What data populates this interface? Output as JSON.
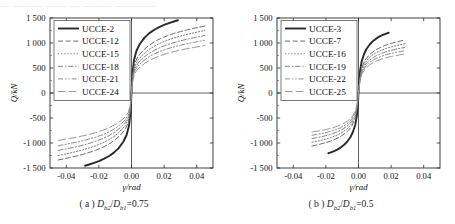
{
  "page": {
    "bleed_text": "— ———  ——  — ———  ————"
  },
  "panels": [
    {
      "id": "panel-a",
      "caption_prefix": "( a )",
      "caption_var_num": "D",
      "caption_sub_num": "b2",
      "caption_var_den": "D",
      "caption_sub_den": "b1",
      "caption_value": "=0.75",
      "caption_full": "( a ) Db2/Db1=0.75",
      "chart_data": {
        "type": "line",
        "title": "",
        "xlabel": "γ/rad",
        "ylabel": "Q/kN",
        "xlim": [
          -0.05,
          0.05
        ],
        "ylim": [
          -1500,
          1500
        ],
        "xticks": [
          -0.04,
          -0.02,
          0.0,
          0.02,
          0.04
        ],
        "xticklabels": [
          "-0.04",
          "-0.02",
          "0.00",
          "0.02",
          "0.04"
        ],
        "yticks": [
          -1500,
          -1000,
          -500,
          0,
          500,
          1000,
          1500
        ],
        "yticklabels": [
          "-1 500",
          "-1 000",
          "-500",
          "0",
          "500",
          "1 000",
          "1 500"
        ],
        "grid": false,
        "legend_position": "upper-left",
        "series": [
          {
            "name": "UCCE-2",
            "style": "solid",
            "width": 1.9,
            "color": "#2b2b2b",
            "x": [
              -0.0285,
              -0.026,
              -0.023,
              -0.02,
              -0.017,
              -0.014,
              -0.011,
              -0.008,
              -0.005,
              -0.003,
              -0.0015,
              -0.0006,
              0,
              0.0006,
              0.0015,
              0.003,
              0.005,
              0.008,
              0.011,
              0.014,
              0.017,
              0.02,
              0.023,
              0.026,
              0.0285
            ],
            "y": [
              -1455,
              -1430,
              -1398,
              -1362,
              -1318,
              -1265,
              -1198,
              -1108,
              -975,
              -840,
              -650,
              -390,
              0,
              390,
              650,
              840,
              975,
              1108,
              1198,
              1265,
              1318,
              1362,
              1398,
              1430,
              1455
            ]
          },
          {
            "name": "UCCE-12",
            "style": "dashed",
            "width": 1.0,
            "color": "#6e6e6e",
            "x": [
              -0.045,
              -0.042,
              -0.038,
              -0.034,
              -0.03,
              -0.026,
              -0.022,
              -0.018,
              -0.014,
              -0.01,
              -0.007,
              -0.004,
              -0.002,
              -0.0008,
              0,
              0.0008,
              0.002,
              0.004,
              0.007,
              0.01,
              0.014,
              0.018,
              0.022,
              0.026,
              0.03,
              0.034,
              0.038,
              0.042,
              0.045
            ],
            "y": [
              -1340,
              -1320,
              -1292,
              -1262,
              -1228,
              -1190,
              -1145,
              -1092,
              -1025,
              -935,
              -848,
              -730,
              -600,
              -380,
              0,
              380,
              600,
              730,
              848,
              935,
              1025,
              1092,
              1145,
              1190,
              1228,
              1262,
              1292,
              1320,
              1340
            ]
          },
          {
            "name": "UCCE-15",
            "style": "dotted",
            "width": 1.0,
            "color": "#7d7d7d",
            "x": [
              -0.045,
              -0.042,
              -0.038,
              -0.034,
              -0.03,
              -0.026,
              -0.022,
              -0.018,
              -0.014,
              -0.01,
              -0.007,
              -0.004,
              -0.002,
              -0.0008,
              0,
              0.0008,
              0.002,
              0.004,
              0.007,
              0.01,
              0.014,
              0.018,
              0.022,
              0.026,
              0.03,
              0.034,
              0.038,
              0.042,
              0.045
            ],
            "y": [
              -1250,
              -1230,
              -1202,
              -1172,
              -1138,
              -1100,
              -1055,
              -1002,
              -938,
              -852,
              -768,
              -658,
              -538,
              -340,
              0,
              340,
              538,
              658,
              768,
              852,
              938,
              1002,
              1055,
              1100,
              1138,
              1172,
              1202,
              1230,
              1250
            ]
          },
          {
            "name": "UCCE-18",
            "style": "dashdot",
            "width": 1.0,
            "color": "#858585",
            "x": [
              -0.045,
              -0.042,
              -0.038,
              -0.034,
              -0.03,
              -0.026,
              -0.022,
              -0.018,
              -0.014,
              -0.01,
              -0.007,
              -0.004,
              -0.002,
              -0.0008,
              0,
              0.0008,
              0.002,
              0.004,
              0.007,
              0.01,
              0.014,
              0.018,
              0.022,
              0.026,
              0.03,
              0.034,
              0.038,
              0.042,
              0.045
            ],
            "y": [
              -1150,
              -1130,
              -1104,
              -1076,
              -1044,
              -1008,
              -966,
              -916,
              -856,
              -776,
              -698,
              -596,
              -486,
              -306,
              0,
              306,
              486,
              596,
              698,
              776,
              856,
              916,
              966,
              1008,
              1044,
              1076,
              1104,
              1130,
              1150
            ]
          },
          {
            "name": "UCCE-21",
            "style": "dashdotdot",
            "width": 1.0,
            "color": "#8d8d8d",
            "x": [
              -0.045,
              -0.042,
              -0.038,
              -0.034,
              -0.03,
              -0.026,
              -0.022,
              -0.018,
              -0.014,
              -0.01,
              -0.007,
              -0.004,
              -0.002,
              -0.0008,
              0,
              0.0008,
              0.002,
              0.004,
              0.007,
              0.01,
              0.014,
              0.018,
              0.022,
              0.026,
              0.03,
              0.034,
              0.038,
              0.042,
              0.045
            ],
            "y": [
              -1055,
              -1036,
              -1012,
              -986,
              -956,
              -922,
              -884,
              -838,
              -782,
              -708,
              -636,
              -542,
              -442,
              -278,
              0,
              278,
              442,
              542,
              636,
              708,
              782,
              838,
              884,
              922,
              956,
              986,
              1012,
              1036,
              1055
            ]
          },
          {
            "name": "UCCE-24",
            "style": "longdash",
            "width": 1.0,
            "color": "#989898",
            "x": [
              -0.045,
              -0.042,
              -0.038,
              -0.034,
              -0.03,
              -0.026,
              -0.022,
              -0.018,
              -0.014,
              -0.01,
              -0.007,
              -0.004,
              -0.002,
              -0.0008,
              0,
              0.0008,
              0.002,
              0.004,
              0.007,
              0.01,
              0.014,
              0.018,
              0.022,
              0.026,
              0.03,
              0.034,
              0.038,
              0.042,
              0.045
            ],
            "y": [
              -950,
              -932,
              -910,
              -886,
              -858,
              -828,
              -792,
              -750,
              -700,
              -632,
              -566,
              -482,
              -392,
              -246,
              0,
              246,
              392,
              482,
              566,
              632,
              700,
              750,
              792,
              828,
              858,
              886,
              910,
              932,
              950
            ]
          }
        ]
      }
    },
    {
      "id": "panel-b",
      "caption_prefix": "( b )",
      "caption_var_num": "D",
      "caption_sub_num": "b2",
      "caption_var_den": "D",
      "caption_sub_den": "b1",
      "caption_value": "=0.5",
      "caption_full": "( b ) Db2/Db1=0.5",
      "chart_data": {
        "type": "line",
        "title": "",
        "xlabel": "γ/rad",
        "ylabel": "Q/kN",
        "xlim": [
          -0.05,
          0.05
        ],
        "ylim": [
          -1500,
          1500
        ],
        "xticks": [
          -0.04,
          -0.02,
          0.0,
          0.02,
          0.04
        ],
        "xticklabels": [
          "-0.04",
          "-0.02",
          "0.00",
          "0.02",
          "0.04"
        ],
        "yticks": [
          -1500,
          -1000,
          -500,
          0,
          500,
          1000,
          1500
        ],
        "yticklabels": [
          "-1 500",
          "-1 000",
          "-500",
          "0",
          "500",
          "1 000",
          "1 500"
        ],
        "grid": false,
        "legend_position": "upper-left",
        "series": [
          {
            "name": "UCCE-3",
            "style": "solid",
            "width": 1.9,
            "color": "#2b2b2b",
            "x": [
              -0.0185,
              -0.017,
              -0.015,
              -0.013,
              -0.011,
              -0.009,
              -0.007,
              -0.005,
              -0.0035,
              -0.002,
              -0.001,
              -0.0004,
              0,
              0.0004,
              0.001,
              0.002,
              0.0035,
              0.005,
              0.007,
              0.009,
              0.011,
              0.013,
              0.015,
              0.017,
              0.0185
            ],
            "y": [
              -1205,
              -1188,
              -1162,
              -1132,
              -1092,
              -1042,
              -975,
              -885,
              -785,
              -640,
              -452,
              -250,
              0,
              250,
              452,
              640,
              785,
              885,
              975,
              1042,
              1092,
              1132,
              1162,
              1188,
              1205
            ]
          },
          {
            "name": "UCCE-7",
            "style": "dashed",
            "width": 1.0,
            "color": "#6e6e6e",
            "x": [
              -0.0285,
              -0.026,
              -0.023,
              -0.02,
              -0.017,
              -0.014,
              -0.011,
              -0.008,
              -0.006,
              -0.004,
              -0.002,
              -0.0008,
              0,
              0.0008,
              0.002,
              0.004,
              0.006,
              0.008,
              0.011,
              0.014,
              0.017,
              0.02,
              0.023,
              0.026,
              0.0285
            ],
            "y": [
              -1060,
              -1042,
              -1018,
              -992,
              -960,
              -920,
              -870,
              -802,
              -740,
              -655,
              -508,
              -288,
              0,
              288,
              508,
              655,
              740,
              802,
              870,
              920,
              960,
              992,
              1018,
              1042,
              1060
            ]
          },
          {
            "name": "UCCE-16",
            "style": "dotted",
            "width": 1.0,
            "color": "#7d7d7d",
            "x": [
              -0.0285,
              -0.026,
              -0.023,
              -0.02,
              -0.017,
              -0.014,
              -0.011,
              -0.008,
              -0.006,
              -0.004,
              -0.002,
              -0.0008,
              0,
              0.0008,
              0.002,
              0.004,
              0.006,
              0.008,
              0.011,
              0.014,
              0.017,
              0.02,
              0.023,
              0.026,
              0.0285
            ],
            "y": [
              -985,
              -968,
              -946,
              -922,
              -892,
              -854,
              -808,
              -744,
              -686,
              -606,
              -470,
              -266,
              0,
              266,
              470,
              606,
              686,
              744,
              808,
              854,
              892,
              922,
              946,
              968,
              985
            ]
          },
          {
            "name": "UCCE-19",
            "style": "dashdot",
            "width": 1.0,
            "color": "#858585",
            "x": [
              -0.0285,
              -0.026,
              -0.023,
              -0.02,
              -0.017,
              -0.014,
              -0.011,
              -0.008,
              -0.006,
              -0.004,
              -0.002,
              -0.0008,
              0,
              0.0008,
              0.002,
              0.004,
              0.006,
              0.008,
              0.011,
              0.014,
              0.017,
              0.02,
              0.023,
              0.026,
              0.0285
            ],
            "y": [
              -912,
              -896,
              -876,
              -854,
              -826,
              -790,
              -748,
              -688,
              -634,
              -560,
              -434,
              -246,
              0,
              246,
              434,
              560,
              634,
              688,
              748,
              790,
              826,
              854,
              876,
              896,
              912
            ]
          },
          {
            "name": "UCCE-22",
            "style": "dashdotdot",
            "width": 1.0,
            "color": "#8d8d8d",
            "x": [
              -0.0285,
              -0.026,
              -0.023,
              -0.02,
              -0.017,
              -0.014,
              -0.011,
              -0.008,
              -0.006,
              -0.004,
              -0.002,
              -0.0008,
              0,
              0.0008,
              0.002,
              0.004,
              0.006,
              0.008,
              0.011,
              0.014,
              0.017,
              0.02,
              0.023,
              0.026,
              0.0285
            ],
            "y": [
              -845,
              -830,
              -812,
              -792,
              -766,
              -732,
              -694,
              -638,
              -588,
              -518,
              -402,
              -228,
              0,
              228,
              402,
              518,
              588,
              638,
              694,
              732,
              766,
              792,
              812,
              830,
              845
            ]
          },
          {
            "name": "UCCE-25",
            "style": "longdash",
            "width": 1.0,
            "color": "#989898",
            "x": [
              -0.0285,
              -0.026,
              -0.023,
              -0.02,
              -0.017,
              -0.014,
              -0.011,
              -0.008,
              -0.006,
              -0.004,
              -0.002,
              -0.0008,
              0,
              0.0008,
              0.002,
              0.004,
              0.006,
              0.008,
              0.011,
              0.014,
              0.017,
              0.02,
              0.023,
              0.026,
              0.0285
            ],
            "y": [
              -780,
              -766,
              -750,
              -731,
              -707,
              -676,
              -640,
              -589,
              -542,
              -478,
              -371,
              -210,
              0,
              210,
              371,
              478,
              542,
              589,
              640,
              676,
              707,
              731,
              750,
              766,
              780
            ]
          }
        ]
      }
    }
  ]
}
